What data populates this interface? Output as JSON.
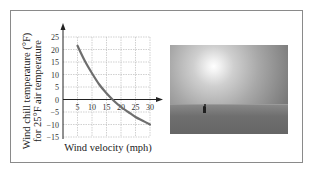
{
  "chart_data": {
    "type": "line",
    "title": "",
    "xlabel": "Wind velocity (mph)",
    "ylabel_line1": "Wind chill temperature (°F)",
    "ylabel_line2": "for 25°F air temperature",
    "xlim": [
      0,
      30
    ],
    "ylim": [
      -15,
      25
    ],
    "grid": true,
    "x_ticks": [
      5,
      10,
      15,
      20,
      25,
      30
    ],
    "x_tick_labels": [
      "5",
      "10",
      "15",
      "20",
      "25",
      "30"
    ],
    "y_ticks": [
      25,
      20,
      15,
      10,
      5,
      0,
      -5,
      -10,
      -15
    ],
    "y_tick_labels": [
      "25",
      "20",
      "15",
      "10",
      "5",
      "0",
      "−5",
      "−10",
      "−15"
    ],
    "series": [
      {
        "name": "Wind chill",
        "x": [
          5,
          7.5,
          10,
          12.5,
          15,
          17.5,
          20,
          22.5,
          25,
          27.5,
          30
        ],
        "y": [
          21.5,
          15.5,
          10.5,
          6,
          2.5,
          -0.5,
          -3,
          -5,
          -7,
          -8.5,
          -10
        ]
      }
    ],
    "line_color": "#6e6e6e"
  },
  "photo": {
    "description": "Photograph of a lone person on a flat, sunlit frozen landscape",
    "icon": "photo-person-on-ice"
  }
}
